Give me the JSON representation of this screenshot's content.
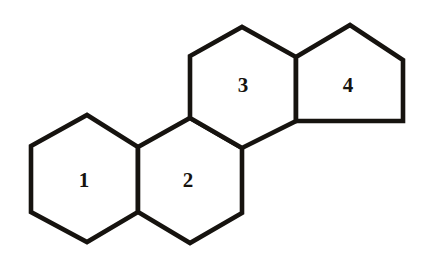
{
  "figure": {
    "background_color": "#ffffff",
    "stroke_color": "#16130f",
    "stroke_width": 4.6,
    "width": 433,
    "height": 257
  },
  "chart_data": {
    "type": "diagram",
    "rings": [
      {
        "label": "1",
        "shape": "hexagon",
        "sides": 6,
        "label_position": {
          "x": 84,
          "y": 180
        },
        "vertices": [
          {
            "x": 31,
            "y": 146
          },
          {
            "x": 87,
            "y": 115
          },
          {
            "x": 138,
            "y": 147
          },
          {
            "x": 138,
            "y": 212
          },
          {
            "x": 87,
            "y": 242
          },
          {
            "x": 31,
            "y": 212
          }
        ]
      },
      {
        "label": "2",
        "shape": "hexagon",
        "sides": 6,
        "label_position": {
          "x": 188,
          "y": 180
        },
        "vertices": [
          {
            "x": 138,
            "y": 147
          },
          {
            "x": 190,
            "y": 118
          },
          {
            "x": 242,
            "y": 148
          },
          {
            "x": 242,
            "y": 213
          },
          {
            "x": 190,
            "y": 243
          },
          {
            "x": 138,
            "y": 212
          }
        ]
      },
      {
        "label": "3",
        "shape": "hexagon",
        "sides": 6,
        "label_position": {
          "x": 243,
          "y": 85
        },
        "vertices": [
          {
            "x": 190,
            "y": 118
          },
          {
            "x": 190,
            "y": 56
          },
          {
            "x": 242,
            "y": 27
          },
          {
            "x": 296,
            "y": 57
          },
          {
            "x": 296,
            "y": 121
          },
          {
            "x": 242,
            "y": 148
          }
        ]
      },
      {
        "label": "4",
        "shape": "pentagon",
        "sides": 5,
        "label_position": {
          "x": 348,
          "y": 85
        },
        "vertices": [
          {
            "x": 296,
            "y": 57
          },
          {
            "x": 350,
            "y": 25
          },
          {
            "x": 403,
            "y": 60
          },
          {
            "x": 403,
            "y": 121
          },
          {
            "x": 296,
            "y": 121
          }
        ]
      }
    ],
    "labels": [
      "1",
      "2",
      "3",
      "4"
    ],
    "legend": [],
    "xlabel": "",
    "ylabel": ""
  }
}
